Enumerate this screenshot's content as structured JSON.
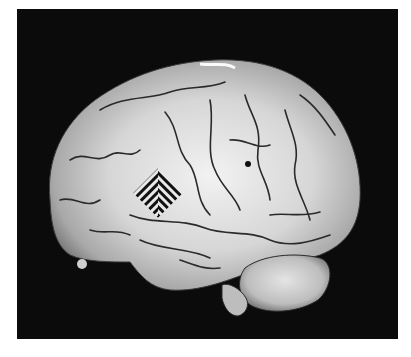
{
  "figure": {
    "background_color": "#0b0b0b",
    "page_color": "#ffffff",
    "brain_color": "#d8d8d8",
    "sulci_color": "#2a2a2a",
    "patch": {
      "shape": "diamond",
      "pattern": "diagonal stripes",
      "stripe_dark": "#111111",
      "stripe_light": "#e8e8e8"
    }
  }
}
